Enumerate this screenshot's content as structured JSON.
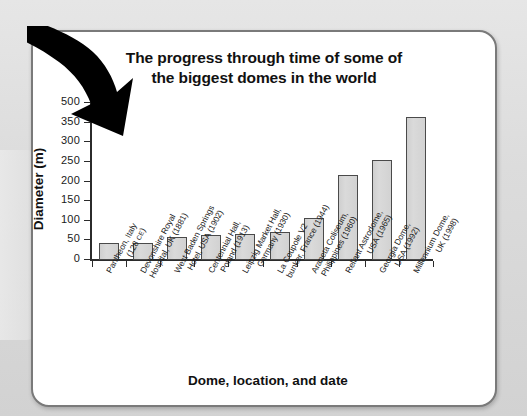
{
  "slide": {
    "arrow_icon": "curved-down-right-arrow"
  },
  "chart_data": {
    "type": "bar",
    "title_line1": "The progress through time of some of",
    "title_line2": "the biggest domes in the world",
    "title": "The progress through time of some of the biggest domes in the world",
    "xlabel": "Dome, location, and date",
    "ylabel": "Diameter (m)",
    "ylim": [
      0,
      400
    ],
    "grid": false,
    "legend": "none",
    "ytick_labels": [
      "0",
      "50",
      "100",
      "150",
      "200",
      "250",
      "300",
      "350",
      "500"
    ],
    "ytick_values": [
      0,
      50,
      100,
      150,
      200,
      250,
      300,
      350,
      400
    ],
    "note": "Top tick is printed as 500 in the source although its position corresponds to 400.",
    "categories": [
      "Pantheon, Italy (128 CE)",
      "Devonshire Royal Hospital, UK (1881)",
      "West Baden Springs Hotel, USA (1902)",
      "Centennial Hall, Poland (1913)",
      "Leipzig Market Hall, Germany (1930)",
      "La Coupole V2 bunker, France (1944)",
      "Araneta Coliseum, Philippines (1960)",
      "Reliant Astrodome, USA (1965)",
      "Georgia Dome, USA (1992)",
      "Millennium Dome, UK (1998)"
    ],
    "category_lines": [
      {
        "l1": "Pantheon, Italy",
        "l2": "(128 ",
        "l2_smallcaps": "CE",
        "l2_tail": ")"
      },
      {
        "l1": "Devonshire Royal",
        "l2": "Hospital, UK (1881)"
      },
      {
        "l1": "West Baden Springs",
        "l2": "Hotel, USA (1902)"
      },
      {
        "l1": "Centennial Hall,",
        "l2": "Poland (1913)"
      },
      {
        "l1": "Leipzig Market Hall,",
        "l2": "Germany (1930)"
      },
      {
        "l1": "La Coupole V2",
        "l2": "bunker, France (1944)"
      },
      {
        "l1": "Araneta Coliseum,",
        "l2": "Philippines (1960)"
      },
      {
        "l1": "Reliant Astrodome,",
        "l2": "USA (1965)"
      },
      {
        "l1": "Georgia Dome,",
        "l2": "USA (1992)"
      },
      {
        "l1": "Millennium Dome,",
        "l2": "UK (1998)"
      }
    ],
    "values": [
      43,
      44,
      59,
      65,
      67,
      71,
      108,
      216,
      256,
      365
    ],
    "colors": {
      "bar_fill": "#d4d4d4",
      "bar_border": "#4a4a4a",
      "axis": "#2b2b2b",
      "text": "#111111",
      "panel_background": "#ffffff",
      "panel_border": "#7a7a7a",
      "slide_background": "#d9d9d9",
      "arrow": "#000000"
    }
  }
}
